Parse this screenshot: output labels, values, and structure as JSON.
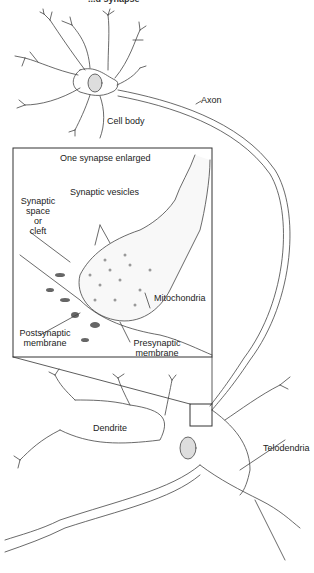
{
  "figure": {
    "title_fragment": "...d synapse",
    "labels": {
      "axon": "Axon",
      "cell_body": "Cell body",
      "inset_title": "One synapse enlarged",
      "synaptic_vesicles": "Synaptic vesicles",
      "synaptic_cleft": [
        "Synaptic",
        "space",
        "or",
        "cleft"
      ],
      "mitochondria": "Mitochondria",
      "postsynaptic": [
        "Postsynaptic",
        "membrane"
      ],
      "presynaptic": [
        "Presynaptic",
        "membrane"
      ],
      "dendrite": "Dendrite",
      "telodendria": "Telodendria"
    },
    "colors": {
      "line": "#333333",
      "background": "#ffffff",
      "shade": "#bbbbbb"
    }
  }
}
